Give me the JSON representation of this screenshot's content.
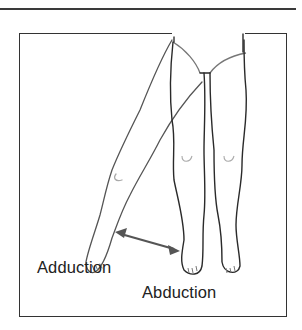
{
  "figure": {
    "labels": {
      "adduction": "Adduction",
      "abduction": "Abduction"
    },
    "colors": {
      "outline": "#2a2a2a",
      "arrow": "#555555",
      "frame": "#333333"
    }
  }
}
